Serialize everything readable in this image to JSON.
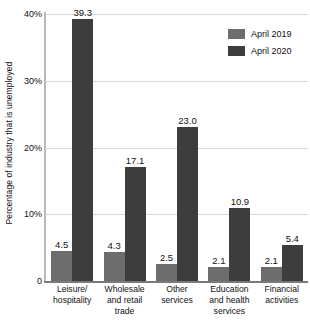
{
  "chart_data": {
    "type": "bar",
    "title": "",
    "xlabel": "",
    "ylabel": "Percentage of industry that is unemployed",
    "ylim": [
      0,
      40
    ],
    "grid": true,
    "legend_position": "top-right",
    "categories": [
      "Leisure/ hospitality",
      "Wholesale and retail trade",
      "Other services",
      "Education and health services",
      "Financial activities"
    ],
    "category_lines": [
      [
        "Leisure/",
        "hospitality"
      ],
      [
        "Wholesale",
        "and retail",
        "trade"
      ],
      [
        "Other",
        "services"
      ],
      [
        "Education",
        "and health",
        "services"
      ],
      [
        "Financial",
        "activities"
      ]
    ],
    "ytick_labels": [
      "0",
      "10%",
      "20%",
      "30%",
      "40%"
    ],
    "ytick_values": [
      0,
      10,
      20,
      30,
      40
    ],
    "series": [
      {
        "name": "April 2019",
        "color": "#6d6d6d",
        "values": [
          4.5,
          4.3,
          2.5,
          2.1,
          2.1
        ],
        "labels": [
          "4.5",
          "4.3",
          "2.5",
          "2.1",
          "2.1"
        ]
      },
      {
        "name": "April 2020",
        "color": "#3d3d3d",
        "values": [
          39.3,
          17.1,
          23.0,
          10.9,
          5.4
        ],
        "labels": [
          "39.3",
          "17.1",
          "23.0",
          "10.9",
          "5.4"
        ]
      }
    ]
  },
  "legend": {
    "items": [
      {
        "label": "April 2019",
        "color": "#6d6d6d"
      },
      {
        "label": "April 2020",
        "color": "#3d3d3d"
      }
    ]
  }
}
